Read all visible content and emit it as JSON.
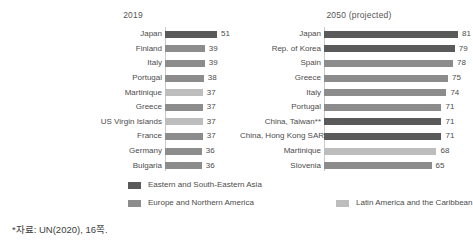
{
  "chart_data": {
    "type": "bar",
    "orientation": "horizontal",
    "title": "",
    "xlabel": "",
    "ylabel": "",
    "grid": false,
    "legend_position": "bottom",
    "xlim": [
      0,
      90
    ],
    "panels": [
      {
        "title": "2019",
        "categories": [
          "Japan",
          "Finland",
          "Italy",
          "Portugal",
          "Martinique",
          "Greece",
          "US Virgin Islands",
          "France",
          "Germany",
          "Bulgaria"
        ],
        "values": [
          51,
          39,
          39,
          38,
          37,
          37,
          37,
          37,
          36,
          36
        ],
        "groups": [
          "Eastern and South-Eastern Asia",
          "Europe and Northern America",
          "Europe and Northern America",
          "Europe and Northern America",
          "Latin America and the Caribbean",
          "Europe and Northern America",
          "Latin America and the Caribbean",
          "Europe and Northern America",
          "Europe and Northern America",
          "Europe and Northern America"
        ]
      },
      {
        "title": "2050 (projected)",
        "categories": [
          "Japan",
          "Rep. of Korea",
          "Spain",
          "Greece",
          "Italy",
          "Portugal",
          "China, Taiwan**",
          "China, Hong Kong SAR",
          "Martinique",
          "Slovenia"
        ],
        "values": [
          81,
          79,
          78,
          75,
          74,
          71,
          71,
          71,
          68,
          65
        ],
        "groups": [
          "Eastern and South-Eastern Asia",
          "Eastern and South-Eastern Asia",
          "Europe and Northern America",
          "Europe and Northern America",
          "Europe and Northern America",
          "Europe and Northern America",
          "Eastern and South-Eastern Asia",
          "Eastern and South-Eastern Asia",
          "Latin America and the Caribbean",
          "Europe and Northern America"
        ]
      }
    ],
    "legend": [
      {
        "label": "Eastern and South-Eastern Asia",
        "color": "#5a5a5a"
      },
      {
        "label": "Europe and Northern America",
        "color": "#8c8c8c"
      },
      {
        "label": "Latin America and the Caribbean",
        "color": "#bdbdbd"
      }
    ]
  },
  "source_note": "*자료: UN(2020), 16쪽.",
  "colors": {
    "eastern_asia": "#5a5a5a",
    "europe_northern_america": "#8c8c8c",
    "latin_america_caribbean": "#bdbdbd",
    "axis": "#c9c9c9",
    "text": "#4c4c4c",
    "background": "#ffffff"
  }
}
